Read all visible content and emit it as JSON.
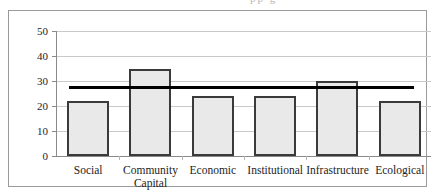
{
  "figure": {
    "frame_border_color": "#9a9a9a",
    "background": "#ffffff",
    "title_sliver_artifact": "pp g"
  },
  "chart_data": {
    "type": "bar",
    "title": "",
    "xlabel": "",
    "ylabel": "",
    "categories": [
      "Social",
      "Community Capital",
      "Economic",
      "Institutional",
      "Infrastructure",
      "Ecological"
    ],
    "category_lines": [
      [
        "Social"
      ],
      [
        "Community",
        "Capital"
      ],
      [
        "Economic"
      ],
      [
        "Institutional"
      ],
      [
        "Infrastructure"
      ],
      [
        "Ecological"
      ]
    ],
    "values": [
      22,
      35,
      24,
      24,
      30,
      22
    ],
    "ylim": [
      0,
      50
    ],
    "yticks": [
      0,
      10,
      20,
      30,
      40,
      50
    ],
    "ytick_labels": [
      "0",
      "10",
      "20",
      "30",
      "40",
      "50"
    ],
    "grid": true,
    "legend": "none",
    "bar_fill_color": "#e9e9e9",
    "bar_border_color": "#3a3a3a",
    "gridline_color": "#c9c9c9",
    "reference_line": {
      "label": "average",
      "value": 27.5,
      "color": "#000000",
      "thickness_px": 3
    }
  }
}
